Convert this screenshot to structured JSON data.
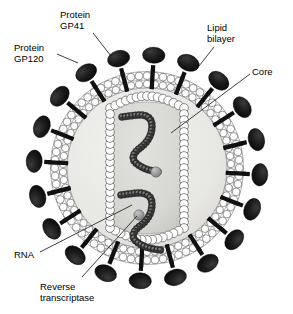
{
  "figure": {
    "background_color": "#ffffff"
  },
  "labels": [
    {
      "id": "gp120",
      "line1": "Protein",
      "line2": "GP120",
      "name": "label-protein-gp120"
    },
    {
      "id": "gp41",
      "line1": "Protein",
      "line2": "GP41",
      "name": "label-protein-gp41"
    },
    {
      "id": "lipid",
      "line1": "Lipid",
      "line2": "bilayer",
      "name": "label-lipid-bilayer"
    },
    {
      "id": "core",
      "line1": "Core",
      "line2": "",
      "name": "label-core"
    },
    {
      "id": "rna",
      "line1": "RNA",
      "line2": "",
      "name": "label-rna"
    },
    {
      "id": "rt",
      "line1": "Reverse",
      "line2": "transcriptase",
      "name": "label-reverse-transcriptase"
    }
  ],
  "structure": {
    "center_x": 147,
    "center_y": 168,
    "envelope_outer_radius": 96,
    "envelope_inner_radius": 82,
    "spike_count": 20,
    "core_label": "Core",
    "rna_strand_count": 2,
    "reverse_transcriptase_count": 2
  },
  "colors": {
    "spike_head": "#1a1a1a",
    "spike_stalk": "#111111",
    "membrane_circle_fill": "#ffffff",
    "membrane_circle_stroke": "#555555",
    "matrix_fill": "#e9e9e7",
    "core_fill": "#d7d7d3",
    "core_circle_fill": "#ffffff",
    "rna_dark": "#3a3a3a",
    "rna_light": "#8a8a8a",
    "enzyme_fill": "#9a9a9a",
    "leader_line": "#222222",
    "text": "#000000"
  }
}
